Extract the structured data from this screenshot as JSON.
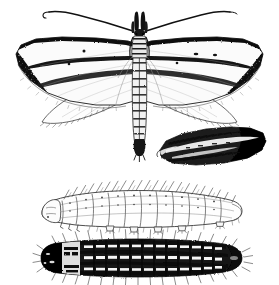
{
  "plate": {
    "title": "Moth and larvae illustration plate",
    "background_color": "#ffffff",
    "ink_color": "#111111",
    "style": "black-and-white engraving / line drawing",
    "width": 279,
    "height": 285,
    "figure_count": 4
  },
  "figures": [
    {
      "id": "adult-moth",
      "label": "Adult moth, spread specimen, dorsal view",
      "description": "Moth with wings spread flat, long slender antennae curving outward, elongate narrow body, pale forewings with dark costal margin and dark apex, two small dark discal spots on the right forewing, rounded pale hindwings beneath with fringed margins",
      "bbox": {
        "x": 10,
        "y": 6,
        "width": 258,
        "height": 165
      }
    },
    {
      "id": "folded-wing",
      "label": "Detached folded wing, lateral view",
      "description": "Single dark wing in resting/folded position, heavily blackened with a pale longitudinal streak and a dark rounded apex",
      "bbox": {
        "x": 155,
        "y": 126,
        "width": 112,
        "height": 42
      }
    },
    {
      "id": "larva-pale-lateral",
      "label": "Larva, lateral view (pale form)",
      "description": "Caterpillar seen from the side, pale body outlined in fine line work, clear segment divisions, dorsal setae angled upward, thoracic legs and abdominal prolegs along the ventral edge",
      "bbox": {
        "x": 36,
        "y": 186,
        "width": 208,
        "height": 44
      }
    },
    {
      "id": "larva-dark-dorsal",
      "label": "Larva, dorsal view (dark form)",
      "description": "Caterpillar seen from above, solid black head capsule, pale prothoracic region, dark longitudinal stripes broken by pale dash-like markings on each segment, radiating lateral setae, tapering dark posterior end",
      "bbox": {
        "x": 36,
        "y": 236,
        "width": 208,
        "height": 44
      }
    }
  ],
  "adult_moth": {
    "antennae": {
      "count": 2,
      "description": "long, slender, smoothly curving; left antenna sweeps up and to the left with a small hooked tip, right antenna sweeps up and to the right"
    },
    "head": {
      "description": "porrect labial palps forming an upturned snout, drawn as dense black strokes"
    },
    "thorax": {
      "description": "narrow, darkly shaded, continuous with the long abdomen"
    },
    "abdomen": {
      "description": "very long and slender, segmented, with a dark anal tuft at the tip"
    },
    "forewing_left": {
      "ground_color": "pale / white",
      "markings": "black costal streak along the leading edge, dense black wing base and apex blotch, dark median line"
    },
    "forewing_right": {
      "ground_color": "pale / white",
      "markings": "black costal streak, dark apical blotch, two small dark discal spots, dark median line"
    },
    "hindwings": {
      "ground_color": "pale / white",
      "markings": "plain, rounded, with a finely fringed outer margin"
    }
  },
  "colors": {
    "paper": "#ffffff",
    "ink": "#111111",
    "ink_mid": "#3a3a3a",
    "ink_light": "#7b7b7b",
    "wing_pale": "#fbfbfb"
  }
}
